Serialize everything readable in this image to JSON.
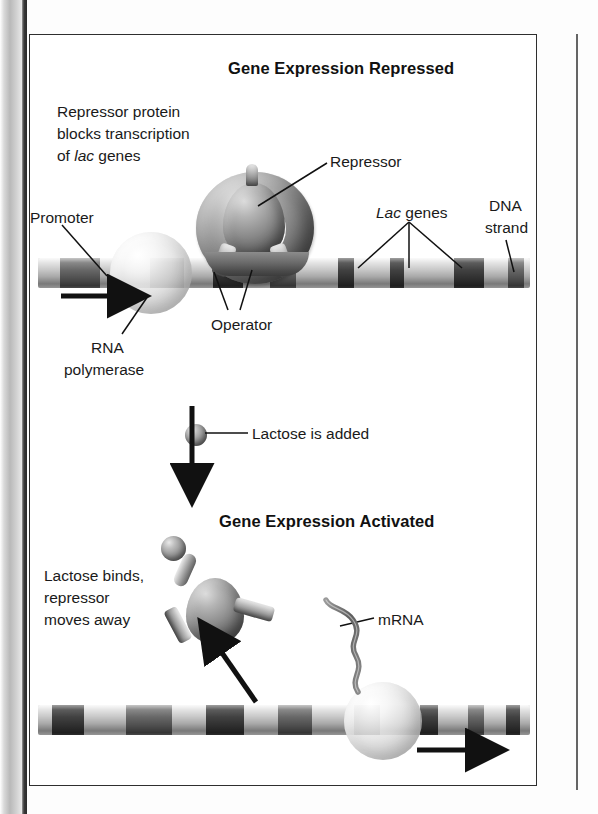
{
  "figure": {
    "kind": "lac-operon-diagram",
    "panels": [
      {
        "id": "repressed",
        "title": "Gene Expression Repressed",
        "labels": {
          "note_line1": "Repressor protein",
          "note_line2": "blocks transcription",
          "note_line3_pre": "of ",
          "note_line3_italic": "lac",
          "note_line3_post": " genes",
          "repressor": "Repressor",
          "promoter": "Promoter",
          "operator": "Operator",
          "rna_poly_line1": "RNA",
          "rna_poly_line2": "polymerase",
          "lac_genes_italic": "Lac",
          "lac_genes_rest": " genes",
          "dna_line1": "DNA",
          "dna_line2": "strand"
        }
      },
      {
        "id": "transition",
        "caption": "Lactose is added"
      },
      {
        "id": "activated",
        "title": "Gene Expression Activated",
        "labels": {
          "note_line1": "Lactose binds,",
          "note_line2": "repressor",
          "note_line3": "moves away",
          "mrna": "mRNA"
        }
      }
    ],
    "colors": {
      "ink": "#111111",
      "frame": "#2e2e2e",
      "page": "#ffffff",
      "dna_base": "#c9c9c9",
      "dna_band": "#6e6e6e",
      "dna_band_dark": "#4a4a4a",
      "protein_dark": "#4b4b4b"
    }
  },
  "chart_data": {
    "type": "diagram",
    "top_dna_bands_px": [
      {
        "x": 22,
        "w": 40,
        "tone": "band"
      },
      {
        "x": 112,
        "w": 34,
        "tone": "band"
      },
      {
        "x": 175,
        "w": 30,
        "tone": "dark"
      },
      {
        "x": 232,
        "w": 26,
        "tone": "band"
      },
      {
        "x": 300,
        "w": 16,
        "tone": "dark"
      },
      {
        "x": 352,
        "w": 14,
        "tone": "dark"
      },
      {
        "x": 416,
        "w": 30,
        "tone": "dark"
      },
      {
        "x": 470,
        "w": 16,
        "tone": "band"
      }
    ],
    "bottom_dna_bands_px": [
      {
        "x": 14,
        "w": 32,
        "tone": "dark"
      },
      {
        "x": 88,
        "w": 46,
        "tone": "band"
      },
      {
        "x": 168,
        "w": 38,
        "tone": "dark"
      },
      {
        "x": 240,
        "w": 34,
        "tone": "band"
      },
      {
        "x": 316,
        "w": 26,
        "tone": "dark"
      },
      {
        "x": 382,
        "w": 18,
        "tone": "dark"
      },
      {
        "x": 430,
        "w": 16,
        "tone": "band"
      },
      {
        "x": 468,
        "w": 14,
        "tone": "dark"
      }
    ]
  }
}
